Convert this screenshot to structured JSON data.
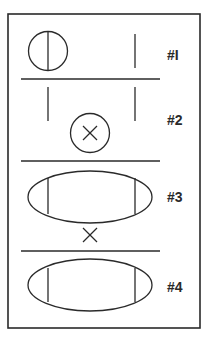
{
  "diagram": {
    "frame": {
      "x": 8,
      "y": 14,
      "width": 192,
      "height": 314,
      "stroke": "#2a2a2a"
    },
    "panels": [
      {
        "label": "#I",
        "label_y": 60,
        "shape": "circle-with-vertical-line",
        "note": "circle on left with vertical line through center; single vertical line on right"
      },
      {
        "label": "#2",
        "label_y": 125,
        "shape": "two-vertical-lines-and-circle-x",
        "note": "two vertical lines above, circle with X centered below"
      },
      {
        "label": "#3",
        "label_y": 202,
        "shape": "ellipse-with-two-vertical-lines",
        "note": "ellipse with two inner vertical lines; X symbol below"
      },
      {
        "label": "#4",
        "label_y": 292,
        "shape": "ellipse-with-two-vertical-lines",
        "note": "ellipse with two inner vertical lines"
      }
    ],
    "dividers_y": [
      79,
      161,
      251
    ],
    "stroke_color": "#2a2a2a",
    "background": "#ffffff"
  }
}
